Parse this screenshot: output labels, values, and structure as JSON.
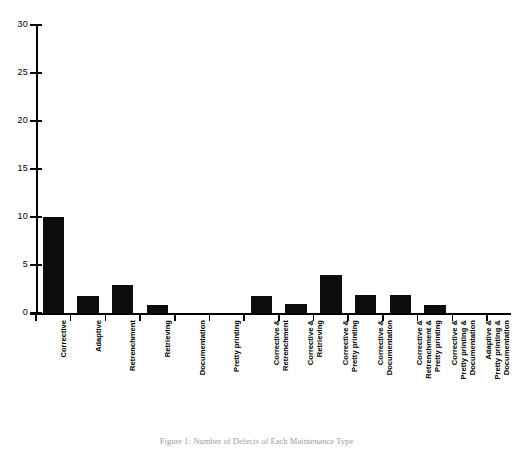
{
  "chart_data": {
    "type": "bar",
    "title": "",
    "xlabel": "",
    "ylabel": "",
    "ylim": [
      0,
      30
    ],
    "ytick_values": [
      0,
      5,
      10,
      15,
      20,
      25,
      30
    ],
    "ytick_labels": [
      "0",
      "5",
      "10",
      "15",
      "20",
      "25",
      "30"
    ],
    "grid": false,
    "legend": "none",
    "categories": [
      "Corrective",
      "Adaptive",
      "Retrenchment",
      "Retrieving",
      "Documentation",
      "Pretty printing",
      "Corrective & Retrenchment",
      "Corrective & Retrieving",
      "Corrective & Pretty printing",
      "Corrective & Documentation",
      "Corrective & Retrenchment & Pretty printing",
      "Corrective & Pretty printing & Documentation",
      "Adaptive & Pretty printing & Documentation"
    ],
    "category_lines": [
      [
        "Corrective"
      ],
      [
        "Adaptive"
      ],
      [
        "Retrenchment"
      ],
      [
        "Retrieving"
      ],
      [
        "Documentation"
      ],
      [
        "Pretty  printing"
      ],
      [
        "Corrective &",
        "Retrenchment"
      ],
      [
        "Corrective &",
        "Retrieving"
      ],
      [
        "Corrective &",
        "Pretty printing"
      ],
      [
        "Corrective &",
        "Documentation"
      ],
      [
        "Corrective &",
        "Retrenchment &",
        "Pretty printing"
      ],
      [
        "Corrective &",
        "Pretty  printing &",
        "Documentation"
      ],
      [
        "Adaptive &",
        "Pretty  printing &",
        "Documentation"
      ]
    ],
    "values": [
      10,
      1.8,
      2.9,
      0.8,
      0,
      0,
      1.8,
      0.9,
      4,
      1.9,
      1.9,
      0.8,
      0
    ],
    "bar_color": "#0d0d0d"
  },
  "caption": {
    "text": "Figure 1: Number of Defects of Each Maintenance Type"
  }
}
